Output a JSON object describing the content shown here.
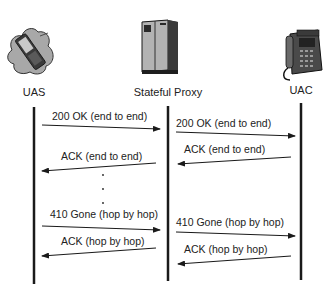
{
  "diagram": {
    "type": "sequence",
    "participants": [
      {
        "id": "uas",
        "label": "UAS",
        "icon": "mobile-phone-icon",
        "x": 34
      },
      {
        "id": "proxy",
        "label": "Stateful Proxy",
        "icon": "server-icon",
        "x": 168
      },
      {
        "id": "uac",
        "label": "UAC",
        "icon": "desk-phone-icon",
        "x": 301
      }
    ],
    "messages": [
      {
        "from": "uas",
        "to": "proxy",
        "label": "200 OK (end to end)"
      },
      {
        "from": "proxy",
        "to": "uac",
        "label": "200 OK (end to end)"
      },
      {
        "from": "proxy",
        "to": "uas",
        "label": "ACK (end to end)"
      },
      {
        "from": "uac",
        "to": "proxy",
        "label": "ACK (end to end)"
      },
      {
        "from": "uas",
        "to": "proxy",
        "label": "410 Gone (hop by hop)"
      },
      {
        "from": "proxy",
        "to": "uac",
        "label": "410 Gone (hop by hop)"
      },
      {
        "from": "proxy",
        "to": "uas",
        "label": "ACK (hop by hop)"
      },
      {
        "from": "uac",
        "to": "proxy",
        "label": "ACK (hop by hop)"
      }
    ],
    "ellipsis": "⋮",
    "colors": {
      "line": "#1a1a1a",
      "text": "#222222",
      "icon_fill": "#9a9a9a",
      "icon_dark": "#2a2a2a"
    }
  }
}
